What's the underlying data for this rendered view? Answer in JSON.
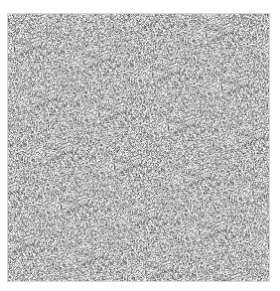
{
  "image": {
    "description": "grayscale noise texture",
    "colors": {
      "background": "#ffffff",
      "mid": "#b8b8b8",
      "dark": "#6e6e6e",
      "light": "#ececec",
      "border": "#d6d6d6"
    }
  }
}
